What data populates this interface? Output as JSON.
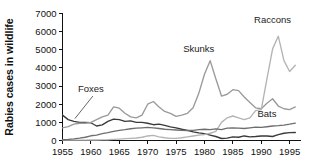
{
  "chart_data": {
    "type": "line",
    "title": "",
    "xlabel": "",
    "ylabel": "Rabies cases in wildlife",
    "xlim": [
      1955,
      1997
    ],
    "ylim": [
      0,
      7000
    ],
    "grid": false,
    "legend_position": "inline-annotations",
    "x_ticks": [
      "1955",
      "1960",
      "1965",
      "1970",
      "1975",
      "1980",
      "1985",
      "1990",
      "1995"
    ],
    "x_tick_values": [
      1955,
      1960,
      1965,
      1970,
      1975,
      1980,
      1985,
      1990,
      1995
    ],
    "y_ticks": [
      "0",
      "1000",
      "2000",
      "3000",
      "4000",
      "5000",
      "6000",
      "7000"
    ],
    "y_tick_values": [
      0,
      1000,
      2000,
      3000,
      4000,
      5000,
      6000,
      7000
    ],
    "x": [
      1955,
      1956,
      1957,
      1958,
      1959,
      1960,
      1961,
      1962,
      1963,
      1964,
      1965,
      1966,
      1967,
      1968,
      1969,
      1970,
      1971,
      1972,
      1973,
      1974,
      1975,
      1976,
      1977,
      1978,
      1979,
      1980,
      1981,
      1982,
      1983,
      1984,
      1985,
      1986,
      1987,
      1988,
      1989,
      1990,
      1991,
      1992,
      1993,
      1994,
      1995,
      1996
    ],
    "series": [
      {
        "name": "Foxes",
        "color": "#3a3a3a",
        "label_x": 1960,
        "label_y": 2700,
        "values": [
          1400,
          1150,
          1050,
          1000,
          1000,
          980,
          800,
          860,
          1050,
          1180,
          1150,
          1050,
          1080,
          1000,
          1000,
          950,
          870,
          900,
          830,
          750,
          700,
          620,
          560,
          480,
          420,
          380,
          300,
          220,
          110,
          130,
          200,
          180,
          250,
          200,
          220,
          250,
          250,
          220,
          320,
          400,
          430,
          440
        ]
      },
      {
        "name": "Skunks",
        "color": "#9a9a9a",
        "label_x": 1979,
        "label_y": 4900,
        "values": [
          700,
          760,
          900,
          950,
          950,
          1000,
          1150,
          1300,
          1400,
          1850,
          1780,
          1500,
          1300,
          1250,
          1400,
          2000,
          2150,
          1850,
          1600,
          1500,
          1330,
          1400,
          1500,
          1800,
          2600,
          3650,
          4400,
          3400,
          2450,
          2550,
          2800,
          2750,
          2400,
          2100,
          1800,
          1750,
          2050,
          2300,
          1900,
          1750,
          1700,
          1850
        ]
      },
      {
        "name": "Raccons",
        "color": "#b4b4b4",
        "label_x": 1992,
        "label_y": 6450,
        "values": [
          20,
          20,
          20,
          25,
          25,
          30,
          30,
          35,
          40,
          60,
          80,
          100,
          120,
          140,
          180,
          250,
          280,
          200,
          150,
          120,
          120,
          150,
          200,
          250,
          300,
          330,
          400,
          500,
          1000,
          1250,
          1350,
          1250,
          1150,
          1250,
          1650,
          1700,
          3400,
          5050,
          5750,
          4400,
          3800,
          4150
        ]
      },
      {
        "name": "Bats",
        "color": "#6e6e6e",
        "label_x": 1991,
        "label_y": 1300,
        "values": [
          40,
          60,
          90,
          130,
          180,
          260,
          300,
          380,
          430,
          500,
          560,
          600,
          650,
          680,
          700,
          720,
          700,
          660,
          620,
          600,
          580,
          560,
          550,
          560,
          600,
          620,
          600,
          640,
          600,
          680,
          700,
          680,
          660,
          700,
          740,
          720,
          760,
          800,
          820,
          850,
          900,
          960
        ]
      }
    ],
    "annotations": [
      {
        "text": "Foxes",
        "target_x": 1957,
        "target_y": 1150
      }
    ]
  }
}
